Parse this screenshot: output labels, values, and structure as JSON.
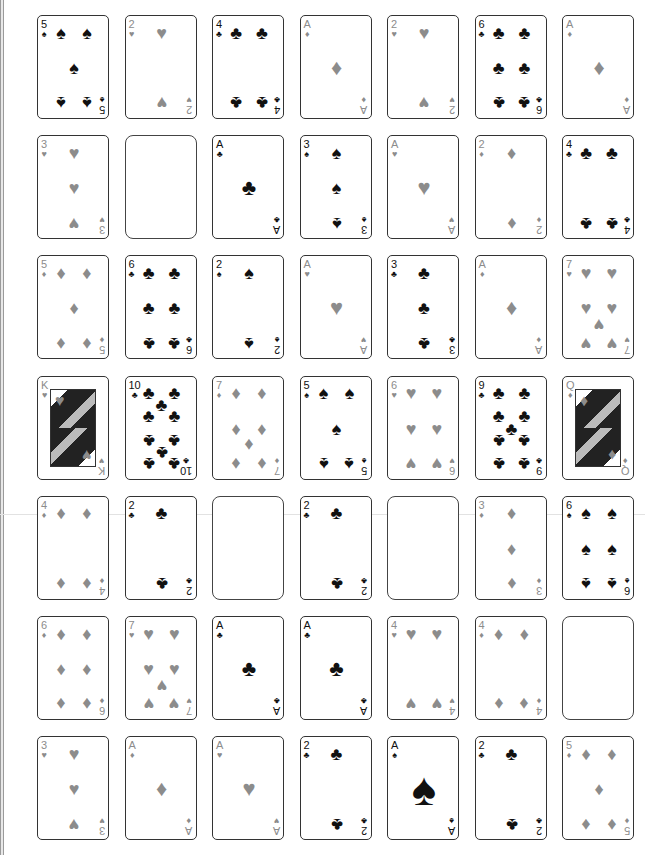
{
  "game": {
    "type": "solitaire-grid",
    "columns": 7,
    "rows": 7,
    "colors": {
      "red_suit": "#8c8c8c",
      "black_suit": "#111111",
      "card_border": "#333333",
      "background": "#ffffff"
    },
    "suit_glyphs": {
      "spades": "♠",
      "hearts": "♥",
      "diamonds": "♦",
      "clubs": "♣"
    }
  },
  "grid": [
    [
      {
        "rank": "5",
        "suit": "spades"
      },
      {
        "rank": "2",
        "suit": "hearts"
      },
      {
        "rank": "4",
        "suit": "clubs"
      },
      {
        "rank": "A",
        "suit": "diamonds"
      },
      {
        "rank": "2",
        "suit": "hearts"
      },
      {
        "rank": "6",
        "suit": "clubs"
      },
      {
        "rank": "A",
        "suit": "diamonds"
      }
    ],
    [
      {
        "rank": "3",
        "suit": "hearts"
      },
      {
        "empty": true
      },
      {
        "rank": "A",
        "suit": "clubs"
      },
      {
        "rank": "3",
        "suit": "spades"
      },
      {
        "rank": "A",
        "suit": "hearts"
      },
      {
        "rank": "2",
        "suit": "diamonds"
      },
      {
        "rank": "4",
        "suit": "clubs"
      }
    ],
    [
      {
        "rank": "5",
        "suit": "diamonds"
      },
      {
        "rank": "6",
        "suit": "clubs"
      },
      {
        "rank": "2",
        "suit": "spades"
      },
      {
        "rank": "A",
        "suit": "hearts"
      },
      {
        "rank": "3",
        "suit": "clubs"
      },
      {
        "rank": "A",
        "suit": "diamonds"
      },
      {
        "rank": "7",
        "suit": "hearts"
      }
    ],
    [
      {
        "rank": "K",
        "suit": "hearts"
      },
      {
        "rank": "10",
        "suit": "clubs"
      },
      {
        "rank": "7",
        "suit": "diamonds"
      },
      {
        "rank": "5",
        "suit": "spades"
      },
      {
        "rank": "6",
        "suit": "hearts"
      },
      {
        "rank": "9",
        "suit": "clubs"
      },
      {
        "rank": "Q",
        "suit": "diamonds"
      }
    ],
    [
      {
        "rank": "4",
        "suit": "diamonds"
      },
      {
        "rank": "2",
        "suit": "clubs"
      },
      {
        "empty": true
      },
      {
        "rank": "2",
        "suit": "clubs"
      },
      {
        "empty": true
      },
      {
        "rank": "3",
        "suit": "diamonds"
      },
      {
        "rank": "6",
        "suit": "spades"
      }
    ],
    [
      {
        "rank": "6",
        "suit": "diamonds"
      },
      {
        "rank": "7",
        "suit": "hearts"
      },
      {
        "rank": "A",
        "suit": "clubs"
      },
      {
        "rank": "A",
        "suit": "clubs"
      },
      {
        "rank": "4",
        "suit": "hearts"
      },
      {
        "rank": "4",
        "suit": "diamonds"
      },
      {
        "empty": true
      }
    ],
    [
      {
        "rank": "3",
        "suit": "hearts"
      },
      {
        "rank": "A",
        "suit": "diamonds"
      },
      {
        "rank": "A",
        "suit": "hearts"
      },
      {
        "rank": "2",
        "suit": "clubs"
      },
      {
        "rank": "A",
        "suit": "spades"
      },
      {
        "rank": "2",
        "suit": "clubs"
      },
      {
        "rank": "5",
        "suit": "diamonds"
      }
    ]
  ]
}
